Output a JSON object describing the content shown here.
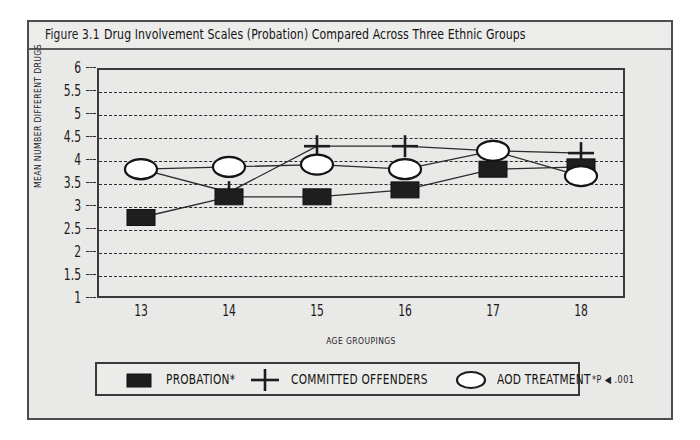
{
  "figure": {
    "number": "Figure 3.1",
    "caption": "Drug Involvement Scales (Probation) Compared Across Three Ethnic Groups",
    "footnote": "*P ◀ .001"
  },
  "legend": {
    "items": [
      {
        "label": "PROBATION*",
        "marker": "filled-square-marker",
        "color": "#1c1c1c"
      },
      {
        "label": "COMMITTED OFFENDERS",
        "marker": "plus-marker",
        "color": "#1c1c1c"
      },
      {
        "label": "AOD TREATMENT",
        "marker": "open-ellipse-marker",
        "color": "#1c1c1c"
      }
    ]
  },
  "chart_data": {
    "type": "line",
    "title": "Drug Involvement Scales (Probation) Compared Across Three Ethnic Groups",
    "xlabel": "AGE GROUPINGS",
    "ylabel": "MEAN NUMBER DIFFERENT DRUGS",
    "categories": [
      "13",
      "14",
      "15",
      "16",
      "17",
      "18"
    ],
    "x": [
      13,
      14,
      15,
      16,
      17,
      18
    ],
    "ylim": [
      1,
      6
    ],
    "xlim": [
      13,
      18
    ],
    "yticks": [
      "1",
      "1.5",
      "2",
      "2.5",
      "3",
      "3.5",
      "4",
      "4.5",
      "5",
      "5.5",
      "6"
    ],
    "ytick_values": [
      1,
      1.5,
      2,
      2.5,
      3,
      3.5,
      4,
      4.5,
      5,
      5.5,
      6
    ],
    "xticks": [
      "13",
      "14",
      "15",
      "16",
      "17",
      "18"
    ],
    "grid": true,
    "grid_style": "dashed-horizontal",
    "legend_position": "below-plot",
    "series": [
      {
        "name": "PROBATION*",
        "marker": "filled-square-marker",
        "values": [
          2.75,
          3.2,
          3.2,
          3.35,
          3.8,
          3.85
        ]
      },
      {
        "name": "COMMITTED OFFENDERS",
        "marker": "plus-marker",
        "values": [
          3.8,
          3.3,
          4.3,
          4.3,
          4.2,
          4.15
        ]
      },
      {
        "name": "AOD TREATMENT",
        "marker": "open-ellipse-marker",
        "values": [
          3.8,
          3.85,
          3.9,
          3.8,
          4.2,
          3.65
        ]
      }
    ]
  }
}
